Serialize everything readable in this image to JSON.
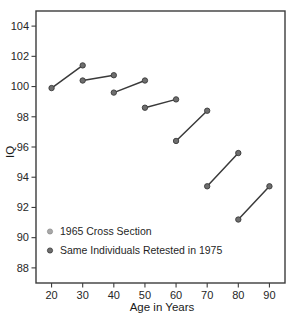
{
  "chart_data": {
    "type": "line",
    "title": "",
    "subtitle": "",
    "xlabel": "Age in Years",
    "ylabel": "IQ",
    "xlim": [
      15,
      95
    ],
    "ylim": [
      87,
      105
    ],
    "xticks": [
      20,
      30,
      40,
      50,
      60,
      70,
      80,
      90
    ],
    "yticks": [
      88,
      90,
      92,
      94,
      96,
      98,
      100,
      102,
      104
    ],
    "xticklabels": [
      "20",
      "30",
      "40",
      "50",
      "60",
      "70",
      "80",
      "90"
    ],
    "yticklabels": [
      "88",
      "90",
      "92",
      "94",
      "96",
      "98",
      "100",
      "102",
      "104"
    ],
    "grid": false,
    "legend_position": "lower-left",
    "legend": [
      {
        "label": "1965 Cross Section",
        "marker": "circle",
        "color": "#a8a8a8"
      },
      {
        "label": "Same Individuals Retested in 1975",
        "marker": "circle",
        "color": "#6e6e6e"
      }
    ],
    "series": [
      {
        "name": "1965 Cross Section",
        "x": [
          20,
          30,
          40,
          50,
          60,
          70,
          80,
          90
        ],
        "values": [
          99.9,
          100.4,
          99.6,
          98.6,
          96.4,
          93.4,
          91.2,
          93.4
        ]
      },
      {
        "name": "Same Individuals Retested in 1975",
        "x": [
          30,
          40,
          50,
          60,
          70,
          80,
          90
        ],
        "values": [
          101.4,
          100.75,
          100.4,
          99.15,
          98.4,
          95.6,
          93.4
        ]
      }
    ],
    "segments": [
      {
        "name": "cohort-20-30",
        "x1": 20,
        "y1": 99.9,
        "x2": 30,
        "y2": 101.4
      },
      {
        "name": "cohort-30-40",
        "x1": 30,
        "y1": 100.4,
        "x2": 40,
        "y2": 100.75
      },
      {
        "name": "cohort-40-50",
        "x1": 40,
        "y1": 99.6,
        "x2": 50,
        "y2": 100.4
      },
      {
        "name": "cohort-50-60",
        "x1": 50,
        "y1": 98.6,
        "x2": 60,
        "y2": 99.15
      },
      {
        "name": "cohort-60-70",
        "x1": 60,
        "y1": 96.4,
        "x2": 70,
        "y2": 98.4
      },
      {
        "name": "cohort-70-80",
        "x1": 70,
        "y1": 93.4,
        "x2": 80,
        "y2": 95.6
      },
      {
        "name": "cohort-80-90",
        "x1": 80,
        "y1": 91.2,
        "x2": 90,
        "y2": 93.4
      }
    ],
    "colors": {
      "line": "#3a3a3a",
      "marker": "#6e6e6e",
      "axis": "#3c3c3c",
      "text": "#1a1a1a",
      "background": "#ffffff"
    }
  }
}
